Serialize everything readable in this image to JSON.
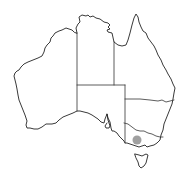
{
  "map": {
    "subject": "Australia",
    "type": "locator map",
    "regions": [
      "Western Australia",
      "Northern Territory",
      "South Australia",
      "Queensland",
      "New South Wales",
      "Victoria",
      "Tasmania"
    ],
    "marker": {
      "shape": "circle",
      "color": "#a0a0a0",
      "location_region": "Victoria",
      "cx": 137,
      "cy": 140,
      "r": 4.5
    },
    "colors": {
      "background": "#ffffff",
      "outline": "#222222"
    }
  }
}
